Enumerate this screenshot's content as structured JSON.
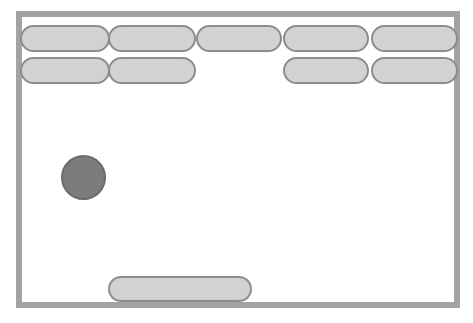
{
  "game": {
    "name": "breakout",
    "screen": {
      "width": 473,
      "height": 323
    },
    "colors": {
      "background": "#ffffff",
      "wall": "#a3a3a3",
      "brick_fill": "#d2d2d2",
      "brick_stroke": "#8c8c8c",
      "ball_fill": "#7c7c7c",
      "ball_stroke": "#6b6b6b",
      "paddle_fill": "#d2d2d2",
      "paddle_stroke": "#8c8c8c"
    },
    "playfield": {
      "label": "playfield",
      "x": 16,
      "y": 11,
      "width": 444,
      "height": 297,
      "wall_thickness": 6
    },
    "walls": [
      {
        "label": "top-wall",
        "x": 16,
        "y": 11,
        "width": 444,
        "height": 6
      },
      {
        "label": "left-wall",
        "x": 16,
        "y": 11,
        "width": 6,
        "height": 297
      },
      {
        "label": "right-wall",
        "x": 454,
        "y": 11,
        "width": 6,
        "height": 297
      },
      {
        "label": "bottom-wall",
        "x": 16,
        "y": 302,
        "width": 444,
        "height": 6
      }
    ],
    "bricks": {
      "rows": 2,
      "columns": 5,
      "total_remaining": 9,
      "destroyed": 1,
      "items": [
        {
          "label": "brick-r1c1",
          "row": 1,
          "col": 1,
          "x": 20,
          "y": 25,
          "width": 90,
          "height": 27,
          "state": "intact"
        },
        {
          "label": "brick-r1c2",
          "row": 1,
          "col": 2,
          "x": 108,
          "y": 25,
          "width": 88,
          "height": 27,
          "state": "intact"
        },
        {
          "label": "brick-r1c3",
          "row": 1,
          "col": 3,
          "x": 196,
          "y": 25,
          "width": 86,
          "height": 27,
          "state": "intact"
        },
        {
          "label": "brick-r1c4",
          "row": 1,
          "col": 4,
          "x": 283,
          "y": 25,
          "width": 86,
          "height": 27,
          "state": "intact"
        },
        {
          "label": "brick-r1c5",
          "row": 1,
          "col": 5,
          "x": 371,
          "y": 25,
          "width": 87,
          "height": 27,
          "state": "intact"
        },
        {
          "label": "brick-r2c1",
          "row": 2,
          "col": 1,
          "x": 20,
          "y": 57,
          "width": 90,
          "height": 27,
          "state": "intact"
        },
        {
          "label": "brick-r2c2",
          "row": 2,
          "col": 2,
          "x": 108,
          "y": 57,
          "width": 88,
          "height": 27,
          "state": "intact"
        },
        {
          "label": "brick-r2c4",
          "row": 2,
          "col": 4,
          "x": 283,
          "y": 57,
          "width": 86,
          "height": 27,
          "state": "intact"
        },
        {
          "label": "brick-r2c5",
          "row": 2,
          "col": 5,
          "x": 371,
          "y": 57,
          "width": 87,
          "height": 27,
          "state": "intact"
        }
      ]
    },
    "ball": {
      "label": "ball",
      "x": 61,
      "y": 155,
      "width": 45,
      "height": 45,
      "center_x": 83,
      "center_y": 177,
      "radius": 22
    },
    "paddle": {
      "label": "paddle",
      "x": 108,
      "y": 276,
      "width": 144,
      "height": 26,
      "center_x": 180
    }
  }
}
